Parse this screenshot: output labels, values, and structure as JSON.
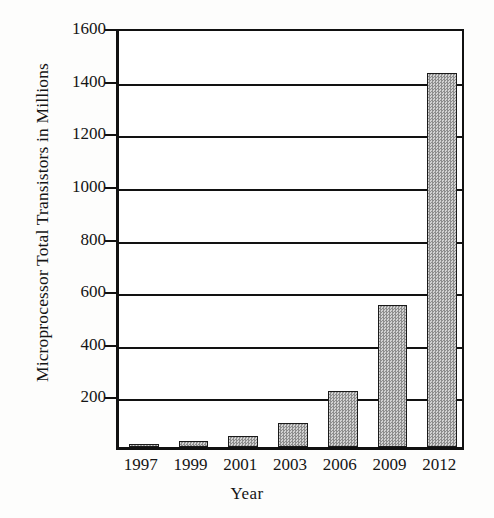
{
  "chart_data": {
    "type": "bar",
    "title": "",
    "xlabel": "Year",
    "ylabel": "Microprocessor Total Transistors in Millions",
    "categories": [
      "1997",
      "1999",
      "2001",
      "2003",
      "2006",
      "2009",
      "2012"
    ],
    "values": [
      7,
      24,
      42,
      90,
      213,
      540,
      1420
    ],
    "ylim": [
      0,
      1600
    ],
    "ytick_labels": [
      "1600",
      "1400",
      "1200",
      "1000",
      "800",
      "600",
      "400",
      "200"
    ],
    "ytick_values": [
      1600,
      1400,
      1200,
      1000,
      800,
      600,
      400,
      200
    ],
    "ytick_step": 200,
    "grid": "horizontal",
    "legend": "none",
    "bar_fill_color": "#a8a8a8",
    "bar_edge_color": "#1a1a1a",
    "axis_color": "#111111",
    "background_color": "#ffffff"
  },
  "axes": {
    "y_title": "Microprocessor Total Transistors in Millions",
    "x_title": "Year"
  }
}
